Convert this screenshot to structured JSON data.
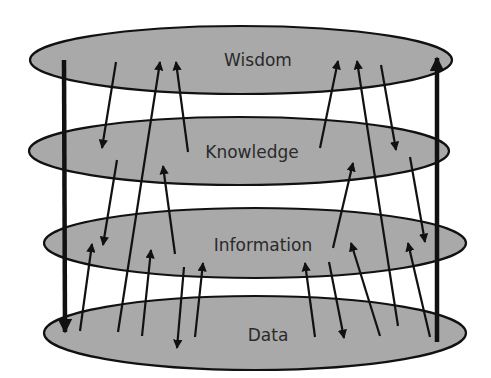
{
  "diagram": {
    "colors": {
      "layer_fill": "#a9a9a9",
      "stroke": "#111111",
      "label": "#2a2a2a",
      "background": "#ffffff"
    },
    "layers": [
      {
        "id": "wisdom",
        "label": "Wisdom",
        "cx": 241,
        "cy": 60,
        "rx": 211,
        "ry": 34,
        "label_x": 258,
        "label_y": 66
      },
      {
        "id": "knowledge",
        "label": "Knowledge",
        "cx": 239,
        "cy": 151,
        "rx": 210,
        "ry": 34,
        "label_x": 252,
        "label_y": 158
      },
      {
        "id": "information",
        "label": "Information",
        "cx": 255,
        "cy": 243,
        "rx": 211,
        "ry": 35,
        "label_x": 263,
        "label_y": 251
      },
      {
        "id": "data",
        "label": "Data",
        "cx": 255,
        "cy": 333,
        "rx": 211,
        "ry": 37,
        "label_x": 268,
        "label_y": 341
      }
    ],
    "arrows": [
      {
        "id": "thick-down-left",
        "from": [
          64,
          60
        ],
        "to": [
          65,
          332
        ],
        "weight": "thick"
      },
      {
        "id": "thick-up-right",
        "from": [
          437,
          342
        ],
        "to": [
          437,
          58
        ],
        "weight": "thick"
      },
      {
        "id": "wisdom-to-knowledge-l",
        "from": [
          116,
          62
        ],
        "to": [
          102,
          148
        ],
        "weight": "thin"
      },
      {
        "id": "data-to-wisdom-l",
        "from": [
          118,
          332
        ],
        "to": [
          160,
          62
        ],
        "weight": "thin"
      },
      {
        "id": "knowledge-to-wisdom-l",
        "from": [
          188,
          152
        ],
        "to": [
          176,
          62
        ],
        "weight": "thin"
      },
      {
        "id": "knowledge-to-info-l",
        "from": [
          117,
          160
        ],
        "to": [
          103,
          245
        ],
        "weight": "thin"
      },
      {
        "id": "info-to-knowledge-l",
        "from": [
          175,
          254
        ],
        "to": [
          163,
          166
        ],
        "weight": "thin"
      },
      {
        "id": "data-to-info-l1",
        "from": [
          80,
          331
        ],
        "to": [
          92,
          244
        ],
        "weight": "thin"
      },
      {
        "id": "data-to-info-l2",
        "from": [
          142,
          336
        ],
        "to": [
          151,
          250
        ],
        "weight": "thin"
      },
      {
        "id": "info-to-data-l",
        "from": [
          184,
          267
        ],
        "to": [
          177,
          348
        ],
        "weight": "thin"
      },
      {
        "id": "data-to-info-l3",
        "from": [
          195,
          337
        ],
        "to": [
          203,
          263
        ],
        "weight": "thin"
      },
      {
        "id": "knowledge-to-wisdom-r",
        "from": [
          320,
          148
        ],
        "to": [
          338,
          61
        ],
        "weight": "thin"
      },
      {
        "id": "data-to-wisdom-r",
        "from": [
          398,
          326
        ],
        "to": [
          357,
          61
        ],
        "weight": "thin"
      },
      {
        "id": "wisdom-to-knowledge-r",
        "from": [
          381,
          65
        ],
        "to": [
          396,
          150
        ],
        "weight": "thin"
      },
      {
        "id": "info-to-knowledge-r",
        "from": [
          333,
          248
        ],
        "to": [
          353,
          163
        ],
        "weight": "thin"
      },
      {
        "id": "knowledge-to-info-r",
        "from": [
          410,
          157
        ],
        "to": [
          425,
          242
        ],
        "weight": "thin"
      },
      {
        "id": "data-to-info-r1",
        "from": [
          315,
          337
        ],
        "to": [
          305,
          263
        ],
        "weight": "thin"
      },
      {
        "id": "info-to-data-r",
        "from": [
          329,
          262
        ],
        "to": [
          344,
          338
        ],
        "weight": "thin"
      },
      {
        "id": "data-to-info-r2",
        "from": [
          380,
          336
        ],
        "to": [
          351,
          243
        ],
        "weight": "thin"
      },
      {
        "id": "data-to-info-r3",
        "from": [
          430,
          337
        ],
        "to": [
          408,
          243
        ],
        "weight": "thin"
      }
    ]
  }
}
